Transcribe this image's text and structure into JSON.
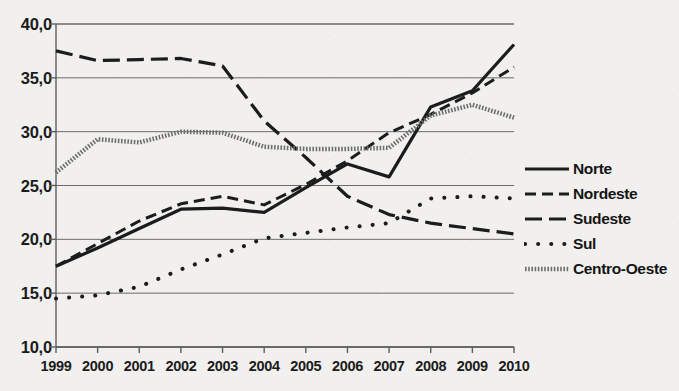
{
  "chart_data": {
    "type": "line",
    "title": "",
    "subtitle": "",
    "xlabel": "",
    "ylabel": "",
    "categories": [
      "1999",
      "2000",
      "2001",
      "2002",
      "2003",
      "2004",
      "2005",
      "2006",
      "2007",
      "2008",
      "2009",
      "2010"
    ],
    "x": [
      1999,
      2000,
      2001,
      2002,
      2003,
      2004,
      2005,
      2006,
      2007,
      2008,
      2009,
      2010
    ],
    "ylim": [
      10.0,
      40.0
    ],
    "xlim": [
      1999,
      2010
    ],
    "y_ticks": [
      10.0,
      15.0,
      20.0,
      25.0,
      30.0,
      35.0,
      40.0
    ],
    "y_tick_labels": [
      "10,0",
      "15,0",
      "20,0",
      "25,0",
      "30,0",
      "35,0",
      "40,0"
    ],
    "decimal_separator": ",",
    "grid": true,
    "grid_axis": "y",
    "legend_position": "right",
    "series": [
      {
        "name": "Norte",
        "style": "solid",
        "color": "#1c1c1c",
        "width": 3.2,
        "values": [
          17.5,
          19.2,
          21.0,
          22.8,
          22.9,
          22.5,
          24.8,
          27.0,
          25.8,
          32.3,
          33.8,
          38.1
        ]
      },
      {
        "name": "Nordeste",
        "style": "dashed",
        "color": "#1c1c1c",
        "width": 3.0,
        "values": [
          17.5,
          19.6,
          21.7,
          23.3,
          24.0,
          23.2,
          25.1,
          27.3,
          29.9,
          31.6,
          33.6,
          36.0
        ]
      },
      {
        "name": "Sudeste",
        "style": "long-dash",
        "color": "#1c1c1c",
        "width": 3.2,
        "values": [
          37.5,
          36.6,
          36.7,
          36.8,
          36.1,
          31.0,
          27.6,
          24.0,
          22.3,
          21.5,
          21.0,
          20.5
        ]
      },
      {
        "name": "Sul",
        "style": "dotted",
        "color": "#1c1c1c",
        "width": 4.0,
        "values": [
          14.5,
          14.8,
          15.6,
          17.2,
          18.6,
          20.1,
          20.6,
          21.1,
          21.5,
          23.8,
          24.0,
          23.8
        ]
      },
      {
        "name": "Centro-Oeste",
        "style": "fine-hatch",
        "color": "#6e6e6e",
        "width": 4.5,
        "values": [
          26.2,
          29.3,
          29.0,
          30.0,
          29.9,
          28.6,
          28.4,
          28.4,
          28.5,
          31.5,
          32.5,
          31.3
        ]
      }
    ]
  },
  "legend": {
    "items": [
      {
        "label": "Norte",
        "style": "solid"
      },
      {
        "label": "Nordeste",
        "style": "dashed"
      },
      {
        "label": "Sudeste",
        "style": "long-dash"
      },
      {
        "label": "Sul",
        "style": "dotted"
      },
      {
        "label": "Centro-Oeste",
        "style": "fine-hatch"
      }
    ]
  },
  "axes": {
    "y_labels": [
      "40,0",
      "35,0",
      "30,0",
      "25,0",
      "20,0",
      "15,0",
      "10,0"
    ],
    "x_labels": [
      "1999",
      "2000",
      "2001",
      "2002",
      "2003",
      "2004",
      "2005",
      "2006",
      "2007",
      "2008",
      "2009",
      "2010"
    ]
  }
}
